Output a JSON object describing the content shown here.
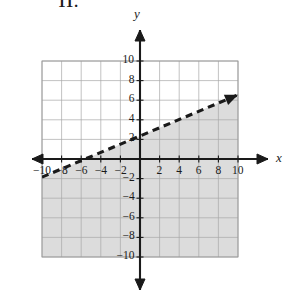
{
  "figure": {
    "corner_label": "11.",
    "axis_labels": {
      "x": "x",
      "y": "y"
    }
  },
  "chart_data": {
    "type": "line",
    "title": "",
    "xlabel": "x",
    "ylabel": "y",
    "xlim": [
      -10,
      10
    ],
    "ylim": [
      -10,
      10
    ],
    "grid": true,
    "grid_step": 2,
    "legend": "none",
    "xticks": [
      -10,
      -8,
      -6,
      -4,
      -2,
      2,
      4,
      6,
      8,
      10
    ],
    "xtick_labels": [
      "−10",
      "−8",
      "−6",
      "−4",
      "−2",
      "2",
      "4",
      "6",
      "8",
      "10"
    ],
    "yticks": [
      10,
      8,
      6,
      4,
      2,
      -2,
      -4,
      -6,
      -8,
      -10
    ],
    "ytick_labels": [
      "10",
      "8",
      "6",
      "4",
      "2",
      "−2",
      "−4",
      "−6",
      "−8",
      "−10"
    ],
    "series": [
      {
        "name": "boundary-line",
        "style": "dashed",
        "color": "#1a1a1a",
        "arrowhead": "right",
        "slope": 0.42,
        "intercept": 2.35,
        "x": [
          -10,
          10
        ],
        "y": [
          -1.85,
          6.55
        ],
        "x_intercept": -5.6,
        "y_intercept": 2.35
      }
    ],
    "shaded_region": {
      "name": "solution-region",
      "relation": "below-line",
      "color": "#dcdcdc",
      "boundary_included": false
    },
    "annotations": []
  }
}
